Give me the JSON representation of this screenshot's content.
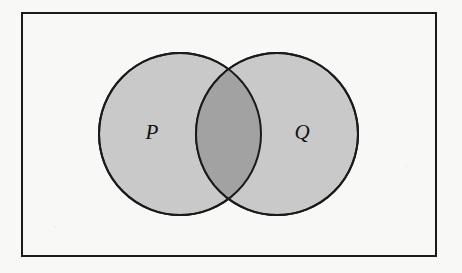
{
  "figure": {
    "type": "venn-diagram",
    "title": "",
    "caption": "",
    "canvas": {
      "width": 462,
      "height": 273
    },
    "background_color": "#f8f8f6"
  },
  "universe_box": {
    "name": "universal-set-rectangle",
    "x": 21,
    "y": 12,
    "width": 416,
    "height": 245,
    "stroke_color": "#1a1a1a",
    "stroke_width": 2,
    "fill_color": "#f8f8f6",
    "label": ""
  },
  "sets": [
    {
      "id": "P",
      "label": "P",
      "center_x": 180,
      "center_y": 134,
      "radius": 81,
      "fill_color": "#c9c9c9",
      "stroke_color": "#1a1a1a",
      "stroke_width": 2,
      "label_x": 152,
      "label_y": 133
    },
    {
      "id": "Q",
      "label": "Q",
      "center_x": 277,
      "center_y": 134,
      "radius": 81,
      "fill_color": "#c9c9c9",
      "stroke_color": "#1a1a1a",
      "stroke_width": 2,
      "label_x": 302,
      "label_y": 133
    }
  ],
  "intersection": {
    "name": "P-and-Q",
    "label": "",
    "shaded": true,
    "fill_color": "#a2a2a2",
    "upper_point_x": 228,
    "upper_point_y": 73,
    "lower_point_x": 228,
    "lower_point_y": 196
  },
  "colors": {
    "ink": "#1a1a1a",
    "set_fill": "#c9c9c9",
    "intersection_fill": "#a2a2a2",
    "paper": "#f8f8f6"
  }
}
